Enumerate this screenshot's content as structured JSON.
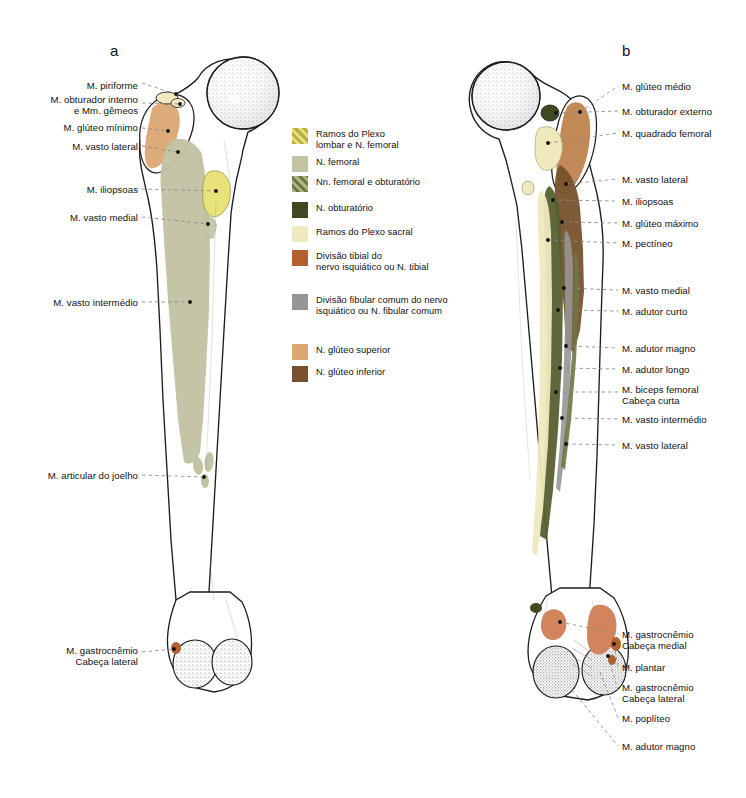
{
  "plate": {
    "panels": [
      {
        "id": "a",
        "letter": "a",
        "view": "anterior"
      },
      {
        "id": "b",
        "letter": "b",
        "view": "posterior"
      }
    ]
  },
  "colors": {
    "plexo_lombar_femoral": "#e9e27a",
    "n_femoral": "#c3c2a3",
    "nn_femoral_obturatorio": "#6f7543",
    "n_obturatorio": "#3f4a21",
    "plexo_sacral": "#efe9bd",
    "divisao_tibial": "#b4602e",
    "divisao_fibular": "#969696",
    "n_gluteo_superior": "#dba672",
    "n_gluteo_inferior": "#78522d",
    "bone_outline": "#1d1d1d",
    "bone_fill": "#ffffff",
    "leader_line": "#8a8a8a",
    "marker_dot": "#101010",
    "background": "#ffffff"
  },
  "legend": {
    "items": [
      {
        "label": "Ramos do Plexo\nlombar e N. femoral",
        "color": "#e9e27a",
        "hatched": true,
        "hatch_color": "#b9b049"
      },
      {
        "label": "N. femoral",
        "color": "#c3c2a3",
        "hatched": false
      },
      {
        "label": "Nn. femoral e obturatório",
        "color": "#6f7543",
        "hatched": true,
        "hatch_color": "#aeb47e"
      },
      {
        "label": "N. obturatório",
        "color": "#3f4a21",
        "hatched": false
      },
      {
        "label": "Ramos do Plexo sacral",
        "color": "#efe9bd",
        "hatched": false
      },
      {
        "label": "Divisão tibial do\nnervo isquiático ou N. tibial",
        "color": "#b4602e",
        "hatched": false
      },
      {
        "label": "Divisão fibular comum do nervo\nisquiático ou N. fibular comum",
        "color": "#969696",
        "hatched": false
      },
      {
        "label": "N.  glúteo superior",
        "color": "#dba672",
        "hatched": false
      },
      {
        "label": "N.  glúteo inferior",
        "color": "#78522d",
        "hatched": false
      }
    ]
  },
  "panel_a": {
    "letter": "a",
    "labels": [
      {
        "text": "M. piriforme",
        "align": "right",
        "x": 28,
        "y": 80,
        "w": 110
      },
      {
        "text": "M. obturador interno\ne Mm. gêmeos",
        "align": "right",
        "x": 4,
        "y": 94,
        "w": 134
      },
      {
        "text": "M.  glúteo mínimo",
        "align": "right",
        "x": 24,
        "y": 122,
        "w": 114
      },
      {
        "text": "M. vasto lateral",
        "align": "right",
        "x": 38,
        "y": 141,
        "w": 100
      },
      {
        "text": "M. iliopsoas",
        "align": "right",
        "x": 52,
        "y": 184,
        "w": 86
      },
      {
        "text": "M. vasto medial",
        "align": "right",
        "x": 38,
        "y": 212,
        "w": 100
      },
      {
        "text": "M. vasto intermédio",
        "align": "right",
        "x": 22,
        "y": 297,
        "w": 116
      },
      {
        "text": "M. articular do joelho",
        "align": "right",
        "x": 16,
        "y": 470,
        "w": 122
      },
      {
        "text": "M. gastrocnêmio\nCabeça lateral",
        "align": "right",
        "x": 34,
        "y": 645,
        "w": 104
      }
    ]
  },
  "panel_b": {
    "letter": "b",
    "labels": [
      {
        "text": "M. glúteo médio",
        "align": "left",
        "x": 622,
        "y": 81,
        "w": 124
      },
      {
        "text": "M. obturador externo",
        "align": "left",
        "x": 622,
        "y": 106,
        "w": 124
      },
      {
        "text": "M. quadrado femoral",
        "align": "left",
        "x": 622,
        "y": 128,
        "w": 124
      },
      {
        "text": "M. vasto lateral",
        "align": "left",
        "x": 622,
        "y": 174,
        "w": 124
      },
      {
        "text": "M. iliopsoas",
        "align": "left",
        "x": 622,
        "y": 196,
        "w": 124
      },
      {
        "text": "M. glúteo máximo",
        "align": "left",
        "x": 622,
        "y": 218,
        "w": 124
      },
      {
        "text": "M. pectíneo",
        "align": "left",
        "x": 622,
        "y": 238,
        "w": 124
      },
      {
        "text": "M. vasto medial",
        "align": "left",
        "x": 622,
        "y": 285,
        "w": 124
      },
      {
        "text": "M. adutor curto",
        "align": "left",
        "x": 622,
        "y": 306,
        "w": 124
      },
      {
        "text": "M. adutor magno",
        "align": "left",
        "x": 622,
        "y": 343,
        "w": 124
      },
      {
        "text": "M. adutor longo",
        "align": "left",
        "x": 622,
        "y": 364,
        "w": 124
      },
      {
        "text": "M. biceps femoral\nCabeça curta",
        "align": "left",
        "x": 622,
        "y": 384,
        "w": 124
      },
      {
        "text": "M. vasto intermédio",
        "align": "left",
        "x": 622,
        "y": 414,
        "w": 124
      },
      {
        "text": "M. vasto lateral",
        "align": "left",
        "x": 622,
        "y": 440,
        "w": 124
      },
      {
        "text": "M. gastrocnêmio\nCabeça medial",
        "align": "left",
        "x": 622,
        "y": 629,
        "w": 124
      },
      {
        "text": "M. plantar",
        "align": "left",
        "x": 622,
        "y": 662,
        "w": 124
      },
      {
        "text": "M. gastrocnêmio\nCabeça lateral",
        "align": "left",
        "x": 622,
        "y": 682,
        "w": 124
      },
      {
        "text": "M. poplíteo",
        "align": "left",
        "x": 622,
        "y": 713,
        "w": 124
      },
      {
        "text": "M. adutor magno",
        "align": "left",
        "x": 622,
        "y": 741,
        "w": 124
      }
    ]
  }
}
